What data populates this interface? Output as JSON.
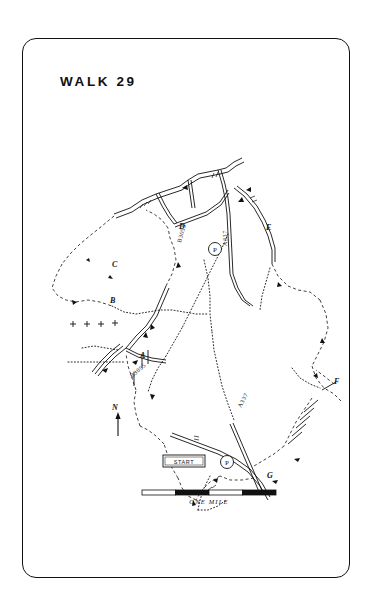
{
  "page": {
    "title": "WALK 29",
    "background": "#ffffff",
    "ink": "#111111"
  },
  "map": {
    "type": "hand-drawn walking route map",
    "waypoints": [
      {
        "id": "A",
        "label": "A",
        "x": 118,
        "y": 320
      },
      {
        "id": "B",
        "label": "B",
        "x": 88,
        "y": 265
      },
      {
        "id": "C",
        "label": "C",
        "x": 90,
        "y": 229
      },
      {
        "id": "D",
        "label": "D",
        "x": 157,
        "y": 191
      },
      {
        "id": "E",
        "label": "E",
        "x": 244,
        "y": 192
      },
      {
        "id": "F",
        "label": "F",
        "x": 312,
        "y": 346
      },
      {
        "id": "G",
        "label": "G",
        "x": 245,
        "y": 440
      }
    ],
    "parking": [
      {
        "label": "P",
        "x": 193,
        "y": 211
      },
      {
        "label": "P",
        "x": 205,
        "y": 424
      }
    ],
    "start_marker": {
      "label": "START",
      "x": 163,
      "y": 423
    },
    "road_labels": [
      {
        "text": "A337",
        "x": 205,
        "y": 208,
        "rotate": -90
      },
      {
        "text": "A337",
        "x": 219,
        "y": 370,
        "rotate": -62
      },
      {
        "text": "B3055",
        "x": 159,
        "y": 205,
        "rotate": -74
      },
      {
        "text": "B3055",
        "x": 110,
        "y": 340,
        "rotate": -40
      }
    ],
    "north_arrow": {
      "label": "N",
      "x": 96,
      "y": 402
    },
    "scale_bar": {
      "label": "ONE MILE",
      "x": 142,
      "y": 492,
      "width": 134,
      "height": 5,
      "segments": [
        "white",
        "black",
        "white",
        "black"
      ]
    }
  }
}
